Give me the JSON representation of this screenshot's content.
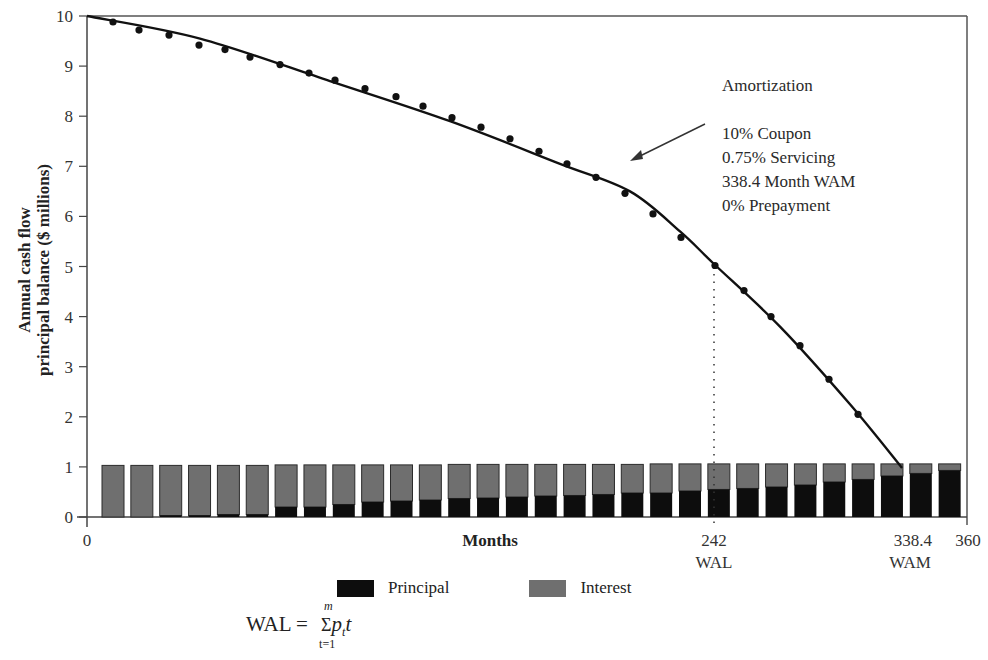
{
  "chart_data": {
    "type": "bar+line",
    "title": "",
    "ylabel_line1": "Annual cash flow",
    "ylabel_line2": "principal balance ($ millions)",
    "xlabel": "Months",
    "ylim": [
      0,
      10
    ],
    "xlim": [
      0,
      360
    ],
    "yticks": [
      "0",
      "1",
      "2",
      "3",
      "4",
      "5",
      "6",
      "7",
      "8",
      "9",
      "10"
    ],
    "xticks": [
      {
        "label": "0",
        "sub": ""
      },
      {
        "label": "242",
        "sub": "WAL"
      },
      {
        "label": "338.4",
        "sub": "WAM"
      },
      {
        "label": "360",
        "sub": ""
      }
    ],
    "grid": false,
    "legend_position": "bottom",
    "legend": [
      {
        "name": "Principal",
        "color": "#0d0d0d"
      },
      {
        "name": "Interest",
        "color": "#6f6f6f"
      }
    ],
    "categories": [
      1,
      2,
      3,
      4,
      5,
      6,
      7,
      8,
      9,
      10,
      11,
      12,
      13,
      14,
      15,
      16,
      17,
      18,
      19,
      20,
      21,
      22,
      23,
      24,
      25,
      26,
      27,
      28,
      29,
      30
    ],
    "series": [
      {
        "name": "Principal",
        "values": [
          0.0,
          0.0,
          0.03,
          0.03,
          0.05,
          0.05,
          0.2,
          0.2,
          0.25,
          0.3,
          0.32,
          0.34,
          0.37,
          0.38,
          0.4,
          0.42,
          0.43,
          0.45,
          0.48,
          0.48,
          0.52,
          0.55,
          0.57,
          0.6,
          0.64,
          0.7,
          0.75,
          0.82,
          0.87,
          0.93
        ]
      },
      {
        "name": "Interest",
        "values": [
          1.03,
          1.03,
          1.0,
          1.0,
          0.98,
          0.98,
          0.84,
          0.84,
          0.79,
          0.74,
          0.72,
          0.7,
          0.68,
          0.67,
          0.65,
          0.63,
          0.62,
          0.6,
          0.57,
          0.58,
          0.54,
          0.51,
          0.49,
          0.46,
          0.42,
          0.36,
          0.31,
          0.24,
          0.19,
          0.13
        ]
      }
    ],
    "balance_curve": {
      "name": "Amortization (principal balance)",
      "x_months": [
        0,
        36,
        72,
        108,
        144,
        180,
        216,
        242,
        280,
        318,
        331
      ],
      "values": [
        10,
        9.5,
        8.9,
        8.15,
        7.25,
        6.2,
        5.05,
        4.98,
        3.5,
        1.9,
        1.0
      ]
    },
    "balance_points": [
      9.88,
      9.72,
      9.62,
      9.42,
      9.33,
      9.18,
      9.03,
      8.86,
      8.72,
      8.55,
      8.39,
      8.2,
      7.97,
      7.78,
      7.55,
      7.3,
      7.05,
      6.78,
      6.46,
      6.05,
      5.58,
      5.02,
      4.52,
      4.0,
      3.42,
      2.75,
      2.05
    ],
    "annotations": {
      "title": "Amortization",
      "lines": [
        "10% Coupon",
        "0.75% Servicing",
        "338.4 Month WAM",
        "0% Prepayment"
      ]
    },
    "wal_month": 242,
    "wam_month": 338.4
  },
  "legend": {
    "principal": "Principal",
    "interest": "Interest"
  },
  "formula": {
    "lhs": "WAL =",
    "sum_top": "m",
    "sum_bottom": "t=1",
    "term": "p",
    "term_sub": "t",
    "term_var": "t"
  }
}
